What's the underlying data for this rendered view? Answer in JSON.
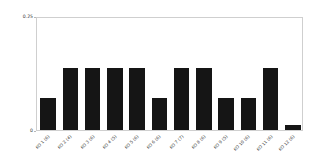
{
  "chart_data": {
    "type": "bar",
    "title": "",
    "xlabel": "",
    "ylabel": "3-compactness",
    "ylim": [
      0,
      0.25
    ],
    "grid": false,
    "legend": null,
    "y_ticks": [
      {
        "value": 0.25,
        "label": "0.25"
      },
      {
        "value": 0.0,
        "label": "0"
      }
    ],
    "categories": [
      "KO 1 (6)",
      "KO 2 (4)",
      "KO 3 (6)",
      "KO 4 (5)",
      "KO 5 (6)",
      "KO 6 (6)",
      "KO 7 (7)",
      "KO 8 (6)",
      "KO 9 (5)",
      "KO 10 (6)",
      "KO 11 (6)",
      "KO 12 (6)"
    ],
    "values": [
      0.07,
      0.135,
      0.135,
      0.135,
      0.135,
      0.07,
      0.135,
      0.135,
      0.07,
      0.07,
      0.135,
      0.012
    ],
    "bar_color": "#151515"
  },
  "figure": {
    "background": "#ffffff",
    "frame_color": "#cfcfcf"
  }
}
